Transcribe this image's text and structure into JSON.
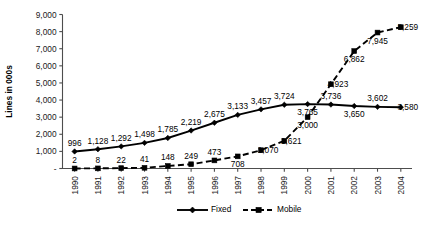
{
  "chart_data": {
    "type": "line",
    "title": "",
    "xlabel": "",
    "ylabel": "Lines in 000s",
    "categories": [
      "1990",
      "1991",
      "1992",
      "1993",
      "1994",
      "1995",
      "1996",
      "1997",
      "1998",
      "1999",
      "2000",
      "2001",
      "2002",
      "2003",
      "2004"
    ],
    "ylim": [
      0,
      9000
    ],
    "y_ticks": [
      "-",
      "1,000",
      "2,000",
      "3,000",
      "4,000",
      "5,000",
      "6,000",
      "7,000",
      "8,000",
      "9,000"
    ],
    "y_tick_values": [
      0,
      1000,
      2000,
      3000,
      4000,
      5000,
      6000,
      7000,
      8000,
      9000
    ],
    "grid": false,
    "legend_position": "bottom",
    "series": [
      {
        "name": "Fixed",
        "marker": "diamond",
        "line_style": "solid",
        "values": [
          996,
          1128,
          1292,
          1498,
          1785,
          2219,
          2675,
          3133,
          3457,
          3724,
          3765,
          3736,
          3650,
          3602,
          3580
        ],
        "labels": [
          "996",
          "1,128",
          "1,292",
          "1,498",
          "1,785",
          "2,219",
          "2,675",
          "3,133",
          "3,457",
          "3,724",
          "3,765",
          "3,736",
          "3,650",
          "3,602",
          "3,580"
        ],
        "label_pos": [
          "above",
          "above",
          "above",
          "above",
          "above",
          "above",
          "above",
          "above",
          "above",
          "above",
          "below",
          "above",
          "below",
          "above",
          "right"
        ]
      },
      {
        "name": "Mobile",
        "marker": "square",
        "line_style": "dashed",
        "values": [
          2,
          8,
          22,
          41,
          148,
          249,
          473,
          708,
          1070,
          1621,
          3000,
          4923,
          6862,
          7945,
          8259
        ],
        "labels": [
          "2",
          "8",
          "22",
          "41",
          "148",
          "249",
          "473",
          "708",
          "1,070",
          "1,621",
          "3,000",
          "4,923",
          "6,862",
          "7,945",
          "8,259"
        ],
        "label_pos": [
          "above",
          "above",
          "above",
          "above",
          "above",
          "above",
          "above",
          "below",
          "right",
          "right",
          "below",
          "right",
          "below",
          "below",
          "right"
        ]
      }
    ]
  },
  "legend": {
    "items": [
      {
        "label": "Fixed"
      },
      {
        "label": "Mobile"
      }
    ]
  },
  "colors": {
    "series": "#000000",
    "axis": "#4d4d4d",
    "text": "#000000",
    "background": "#ffffff"
  }
}
